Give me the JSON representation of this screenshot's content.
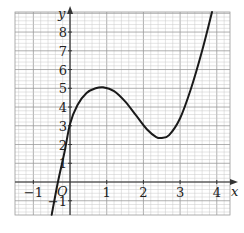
{
  "chart_data": {
    "type": "line",
    "title": "",
    "xlabel": "x",
    "ylabel": "y",
    "origin_label": "O",
    "xlim": [
      -1.5,
      4.36
    ],
    "ylim": [
      -1.76,
      9.07
    ],
    "grid": true,
    "grid_minor_step_x": 0.2,
    "grid_minor_step_y": 0.2,
    "x_ticks": [
      {
        "value": -1,
        "label": "−1"
      },
      {
        "value": 1,
        "label": "1"
      },
      {
        "value": 2,
        "label": "2"
      },
      {
        "value": 3,
        "label": "3"
      },
      {
        "value": 4,
        "label": "4"
      }
    ],
    "y_ticks": [
      {
        "value": -1,
        "label": "−1"
      },
      {
        "value": 1,
        "label": "1"
      },
      {
        "value": 2,
        "label": "2"
      },
      {
        "value": 3,
        "label": "3"
      },
      {
        "value": 4,
        "label": "4"
      },
      {
        "value": 5,
        "label": "5"
      },
      {
        "value": 6,
        "label": "6"
      },
      {
        "value": 7,
        "label": "7"
      },
      {
        "value": 8,
        "label": "8"
      }
    ],
    "series": [
      {
        "name": "curve",
        "x": [
          -0.5,
          -0.33,
          -0.15,
          0,
          0.2,
          0.45,
          0.7,
          0.9,
          1.2,
          1.5,
          1.8,
          2.1,
          2.35,
          2.5,
          2.7,
          3.0,
          3.3,
          3.6,
          3.87
        ],
        "y": [
          -1.75,
          0,
          1.6,
          3.1,
          4.1,
          4.75,
          5.0,
          5.05,
          4.85,
          4.3,
          3.55,
          2.8,
          2.4,
          2.35,
          2.5,
          3.4,
          5.0,
          7.0,
          9.07
        ]
      }
    ],
    "features": {
      "local_max": [
        0.9,
        5.05
      ],
      "local_min": [
        2.5,
        2.35
      ],
      "y_intercept": 3.1,
      "x_intercept": -0.33
    }
  },
  "colors": {
    "grid_minor": "#c8c8c8",
    "grid_major": "#9a9a9a",
    "axis": "#333333",
    "curve": "#1a1a1a"
  }
}
